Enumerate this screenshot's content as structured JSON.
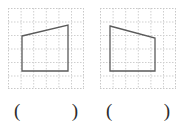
{
  "page": {
    "background_color": "#ffffff"
  },
  "style": {
    "grid_line_color": "#cfcfcf",
    "grid_border_color": "#c8c8c8",
    "shape_stroke_color": "#5a5a5a",
    "shape_fill": "none",
    "shape_stroke_width": 1.3,
    "paren_color": "#2b2b2b"
  },
  "figures": [
    {
      "id": "figure-1",
      "name": "left-quadrilateral",
      "grid": {
        "x": 8,
        "y": 8,
        "width": 76,
        "height": 81,
        "cols": 6,
        "rows": 6,
        "cell_width": 12.6,
        "cell_height": 13.5,
        "border_style": "dashed",
        "line_style": "dashed"
      },
      "shape": {
        "type": "quadrilateral",
        "description": "right trapezoid with slanted top edge rising to the right",
        "vertices": [
          {
            "label": "top-left",
            "x": 14,
            "y": 28
          },
          {
            "label": "top-right",
            "x": 60,
            "y": 17
          },
          {
            "label": "bottom-right",
            "x": 60,
            "y": 63
          },
          {
            "label": "bottom-left",
            "x": 14,
            "y": 63
          }
        ],
        "points_attr": "14,28 60,17 60,63 14,63"
      }
    },
    {
      "id": "figure-2",
      "name": "right-quadrilateral",
      "grid": {
        "x": 100,
        "y": 8,
        "width": 76,
        "height": 81,
        "cols": 6,
        "rows": 6,
        "cell_width": 12.6,
        "cell_height": 13.5,
        "border_style": "dashed",
        "line_style": "dashed"
      },
      "shape": {
        "type": "quadrilateral",
        "description": "right trapezoid with slanted top edge descending to the right",
        "vertices": [
          {
            "label": "top-left",
            "x": 10,
            "y": 18
          },
          {
            "label": "top-right",
            "x": 55,
            "y": 30
          },
          {
            "label": "bottom-right",
            "x": 55,
            "y": 63
          },
          {
            "label": "bottom-left",
            "x": 10,
            "y": 63
          }
        ],
        "points_attr": "10,18 55,30 55,63 10,63"
      }
    }
  ],
  "answers": [
    {
      "id": "answer-1",
      "for_figure": "figure-1",
      "open_paren": "(",
      "close_paren": ")",
      "value": ""
    },
    {
      "id": "answer-2",
      "for_figure": "figure-2",
      "open_paren": "(",
      "close_paren": ")",
      "value": ""
    }
  ]
}
